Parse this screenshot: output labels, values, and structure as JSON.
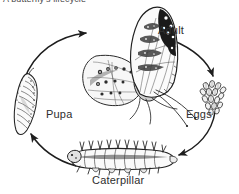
{
  "figure": {
    "title": "A butterfly's lifecycle",
    "title_clipped": true,
    "background_color": "#ffffff",
    "ink_color": "#2e2e2e",
    "width": 239,
    "height": 194
  },
  "labels": {
    "adult": "Adult",
    "eggs": "Eggs",
    "pupa": "Pupa",
    "caterpillar": "Caterpillar"
  },
  "stages": [
    {
      "name": "Adult",
      "position": "top-center",
      "label": "Adult"
    },
    {
      "name": "Eggs",
      "position": "right",
      "label": "Eggs"
    },
    {
      "name": "Caterpillar",
      "position": "bottom-center",
      "label": "Caterpillar"
    },
    {
      "name": "Pupa",
      "position": "left",
      "label": "Pupa"
    }
  ],
  "arrows": [
    {
      "from": "Adult",
      "to": "Eggs",
      "direction": "clockwise"
    },
    {
      "from": "Eggs",
      "to": "Caterpillar",
      "direction": "clockwise"
    },
    {
      "from": "Caterpillar",
      "to": "Pupa",
      "direction": "clockwise"
    },
    {
      "from": "Pupa",
      "to": "Adult",
      "direction": "clockwise"
    }
  ]
}
